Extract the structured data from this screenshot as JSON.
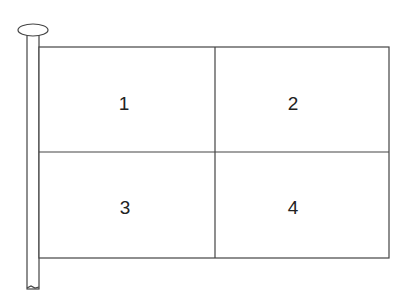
{
  "diagram": {
    "line_color": "#444444",
    "quadrants": [
      {
        "label": "1",
        "position": "top-left"
      },
      {
        "label": "2",
        "position": "top-right"
      },
      {
        "label": "3",
        "position": "bottom-left"
      },
      {
        "label": "4",
        "position": "bottom-right"
      }
    ]
  }
}
